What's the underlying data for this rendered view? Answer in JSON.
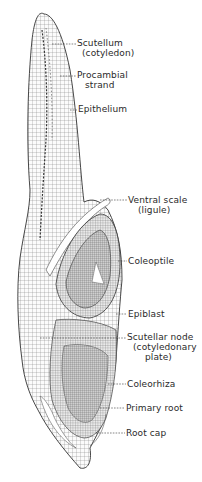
{
  "figure": {
    "labels": [
      {
        "id": "scutellum",
        "lines": [
          "Scutellum",
          "(cotyledon)"
        ],
        "x": 77,
        "y": 38
      },
      {
        "id": "procambial-strand",
        "lines": [
          "Procambial",
          "strand"
        ],
        "x": 77,
        "y": 70
      },
      {
        "id": "epithelium",
        "lines": [
          "Epithelium"
        ],
        "x": 78,
        "y": 104
      },
      {
        "id": "ventral-scale",
        "lines": [
          "Ventral scale",
          "(ligule)"
        ],
        "x": 128,
        "y": 195
      },
      {
        "id": "coleoptile",
        "lines": [
          "Coleoptile"
        ],
        "x": 128,
        "y": 256
      },
      {
        "id": "epiblast",
        "lines": [
          "Epiblast"
        ],
        "x": 128,
        "y": 309
      },
      {
        "id": "scutellar-node",
        "lines": [
          "Scutellar node",
          "(cotyledonary",
          "plate)"
        ],
        "x": 127,
        "y": 332
      },
      {
        "id": "coleorhiza",
        "lines": [
          "Coleorhiza"
        ],
        "x": 127,
        "y": 379
      },
      {
        "id": "primary-root",
        "lines": [
          "Primary root"
        ],
        "x": 126,
        "y": 403
      },
      {
        "id": "root-cap",
        "lines": [
          "Root cap"
        ],
        "x": 126,
        "y": 428
      }
    ]
  }
}
